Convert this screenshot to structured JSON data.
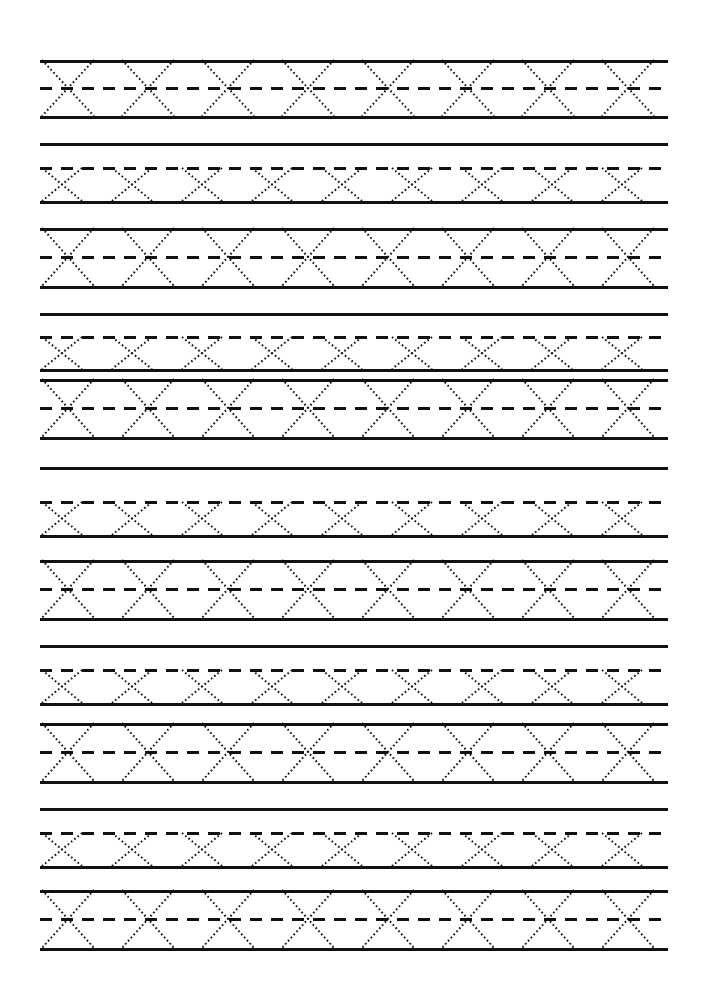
{
  "worksheet": {
    "letter": "X",
    "title": "Letter X Tracing Practice Worksheet",
    "page_width": 706,
    "page_height": 996,
    "background_color": "#ffffff",
    "ink_color": "#111111",
    "margin_left": 40,
    "margin_right": 668,
    "solid_line_width": 3,
    "dashed_line_width": 3,
    "dash_pattern": "12 9",
    "trace_dot_pattern": "1.6 2.6",
    "trace_stroke_width": 2,
    "row_types": {
      "tall": {
        "label": "full-height-row",
        "height": 55,
        "glyph_count": 8,
        "glyph_width": 52,
        "glyph_step": 80,
        "first_glyph_x": 42,
        "has_top_solid": true,
        "has_mid_dashed": true,
        "has_base_solid": true
      },
      "short": {
        "label": "half-height-row",
        "height": 38,
        "glyph_count": 9,
        "glyph_width": 40,
        "glyph_step": 70,
        "first_glyph_x": 42,
        "has_top_dashed": true,
        "has_base_solid": true
      }
    },
    "lines": [
      {
        "id": "l01",
        "y": 60,
        "style": "solid",
        "role": "row1-top"
      },
      {
        "id": "l02",
        "y": 88,
        "style": "dashed",
        "role": "row1-mid"
      },
      {
        "id": "l03",
        "y": 116,
        "style": "solid",
        "role": "row1-base"
      },
      {
        "id": "l04",
        "y": 143,
        "style": "solid",
        "role": "separator"
      },
      {
        "id": "l05",
        "y": 168,
        "style": "dashed",
        "role": "row2-top"
      },
      {
        "id": "l06",
        "y": 201,
        "style": "solid",
        "role": "row2-base"
      },
      {
        "id": "l07",
        "y": 228,
        "style": "solid",
        "role": "row3-top"
      },
      {
        "id": "l08",
        "y": 257,
        "style": "dashed",
        "role": "row3-mid"
      },
      {
        "id": "l09",
        "y": 286,
        "style": "solid",
        "role": "row3-base"
      },
      {
        "id": "l10",
        "y": 313,
        "style": "solid",
        "role": "separator"
      },
      {
        "id": "l11",
        "y": 337,
        "style": "dashed",
        "role": "row4-top"
      },
      {
        "id": "l12",
        "y": 369,
        "style": "solid",
        "role": "row4-base"
      },
      {
        "id": "l13",
        "y": 379,
        "style": "solid",
        "role": "row5-top"
      },
      {
        "id": "l14",
        "y": 408,
        "style": "dashed",
        "role": "row5-mid"
      },
      {
        "id": "l15",
        "y": 437,
        "style": "solid",
        "role": "row5-base"
      },
      {
        "id": "l16",
        "y": 467,
        "style": "solid",
        "role": "separator"
      },
      {
        "id": "l17",
        "y": 502,
        "style": "dashed",
        "role": "row6-top"
      },
      {
        "id": "l18",
        "y": 535,
        "style": "solid",
        "role": "row6-base"
      },
      {
        "id": "l19",
        "y": 560,
        "style": "solid",
        "role": "row7-top"
      },
      {
        "id": "l20",
        "y": 589,
        "style": "dashed",
        "role": "row7-mid"
      },
      {
        "id": "l21",
        "y": 618,
        "style": "solid",
        "role": "row7-base"
      },
      {
        "id": "l22",
        "y": 645,
        "style": "solid",
        "role": "separator"
      },
      {
        "id": "l23",
        "y": 670,
        "style": "dashed",
        "role": "row8-top"
      },
      {
        "id": "l24",
        "y": 703,
        "style": "solid",
        "role": "row8-base"
      },
      {
        "id": "l25",
        "y": 723,
        "style": "solid",
        "role": "row9-top"
      },
      {
        "id": "l26",
        "y": 752,
        "style": "dashed",
        "role": "row9-mid"
      },
      {
        "id": "l27",
        "y": 781,
        "style": "solid",
        "role": "row9-base"
      },
      {
        "id": "l28",
        "y": 808,
        "style": "solid",
        "role": "separator"
      },
      {
        "id": "l29",
        "y": 833,
        "style": "dashed",
        "role": "row10-top"
      },
      {
        "id": "l30",
        "y": 866,
        "style": "solid",
        "role": "row10-base"
      },
      {
        "id": "l31",
        "y": 890,
        "style": "solid",
        "role": "row11-top"
      },
      {
        "id": "l32",
        "y": 919,
        "style": "dashed",
        "role": "row11-mid"
      },
      {
        "id": "l33",
        "y": 948,
        "style": "solid",
        "role": "row11-base"
      }
    ],
    "rows": [
      {
        "id": "row1",
        "type": "tall",
        "top": 60,
        "bottom": 116,
        "mid": 88
      },
      {
        "id": "row2",
        "type": "short",
        "top": 168,
        "bottom": 201,
        "mid": null
      },
      {
        "id": "row3",
        "type": "tall",
        "top": 228,
        "bottom": 286,
        "mid": 257
      },
      {
        "id": "row4",
        "type": "short",
        "top": 337,
        "bottom": 369,
        "mid": null
      },
      {
        "id": "row5",
        "type": "tall",
        "top": 379,
        "bottom": 437,
        "mid": 408
      },
      {
        "id": "row6",
        "type": "short",
        "top": 502,
        "bottom": 535,
        "mid": null
      },
      {
        "id": "row7",
        "type": "tall",
        "top": 560,
        "bottom": 618,
        "mid": 589
      },
      {
        "id": "row8",
        "type": "short",
        "top": 670,
        "bottom": 703,
        "mid": null
      },
      {
        "id": "row9",
        "type": "tall",
        "top": 723,
        "bottom": 781,
        "mid": 752
      },
      {
        "id": "row10",
        "type": "short",
        "top": 833,
        "bottom": 866,
        "mid": null
      },
      {
        "id": "row11",
        "type": "tall",
        "top": 890,
        "bottom": 948,
        "mid": 919
      }
    ]
  }
}
